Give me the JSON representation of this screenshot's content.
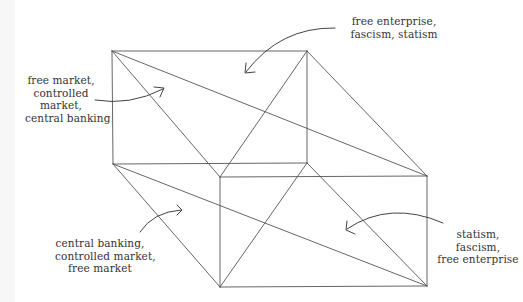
{
  "diagram": {
    "type": "perspective-box",
    "colors": {
      "line": "#555555",
      "arrow": "#444444",
      "text": "#333333",
      "background": "#ffffff"
    },
    "vertices": {
      "back_top_left": [
        112,
        51
      ],
      "back_top_right": [
        307,
        51
      ],
      "back_bottom_left": [
        113,
        164
      ],
      "back_bottom_right": [
        307,
        163
      ],
      "front_top_left": [
        220,
        177
      ],
      "front_top_right": [
        427,
        176
      ],
      "front_bottom_left": [
        220,
        287
      ],
      "front_bottom_right": [
        427,
        286
      ]
    },
    "edges": [
      [
        "back_top_left",
        "back_top_right"
      ],
      [
        "back_top_right",
        "back_bottom_right"
      ],
      [
        "back_bottom_right",
        "back_bottom_left"
      ],
      [
        "back_bottom_left",
        "back_top_left"
      ],
      [
        "front_top_left",
        "front_top_right"
      ],
      [
        "front_top_right",
        "front_bottom_right"
      ],
      [
        "front_bottom_right",
        "front_bottom_left"
      ],
      [
        "front_bottom_left",
        "front_top_left"
      ],
      [
        "back_top_left",
        "front_top_right"
      ],
      [
        "back_top_right",
        "front_top_right"
      ],
      [
        "back_top_left",
        "front_top_left"
      ],
      [
        "back_top_right",
        "front_top_left"
      ],
      [
        "back_bottom_left",
        "front_bottom_right"
      ],
      [
        "back_bottom_left",
        "front_bottom_left"
      ],
      [
        "back_bottom_right",
        "front_bottom_left"
      ],
      [
        "back_bottom_right",
        "front_bottom_right"
      ]
    ]
  },
  "labels": {
    "top_left": {
      "lines": [
        "free market,",
        "controlled",
        "market,",
        "central banking"
      ]
    },
    "top_right": {
      "lines": [
        "free enterprise,",
        "fascism, statism"
      ]
    },
    "bottom_left": {
      "lines": [
        "central banking,",
        "controlled market,",
        "free market"
      ]
    },
    "bottom_right": {
      "lines": [
        "statism,",
        "fascism,",
        "free enterprise"
      ]
    }
  },
  "arrows": {
    "top_left": {
      "from": [
        95,
        100
      ],
      "to": [
        163,
        89
      ],
      "icon": "curved-arrow-right"
    },
    "top_right": {
      "from": [
        335,
        28
      ],
      "to": [
        246,
        73
      ],
      "icon": "curved-arrow-down-left"
    },
    "bottom_left": {
      "from": [
        140,
        232
      ],
      "to": [
        181,
        210
      ],
      "icon": "curved-arrow-up-right"
    },
    "bottom_right": {
      "from": [
        443,
        223
      ],
      "to": [
        347,
        229
      ],
      "icon": "curved-arrow-left"
    }
  }
}
